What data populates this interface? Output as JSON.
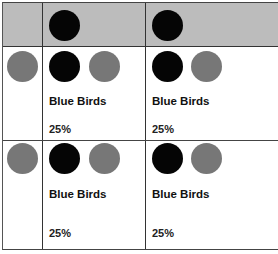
{
  "colors": {
    "header_bg": "#bcbcbc",
    "dot_dark": "#050505",
    "dot_gray": "#777777",
    "border": "#333333"
  },
  "rows": [
    {
      "cells": [
        {
          "label": "Blue Birds",
          "percent": "25%"
        },
        {
          "label": "Blue Birds",
          "percent": "25%"
        }
      ]
    },
    {
      "cells": [
        {
          "label": "Blue Birds",
          "percent": "25%"
        },
        {
          "label": "Blue Birds",
          "percent": "25%"
        }
      ]
    }
  ]
}
